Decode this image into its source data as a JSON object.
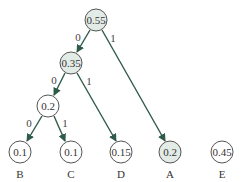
{
  "diagram": {
    "type": "huffman-tree",
    "colors": {
      "edge": "#2f5a48",
      "shaded_node": "#e2ebe6",
      "node_border": "#555555"
    },
    "nodes": {
      "root": {
        "value": "0.55",
        "shaded": true
      },
      "n035": {
        "value": "0.35",
        "shaded": true
      },
      "n02": {
        "value": "0.2",
        "shaded": false
      },
      "B": {
        "value": "0.1",
        "label": "B",
        "shaded": false
      },
      "C": {
        "value": "0.1",
        "label": "C",
        "shaded": false
      },
      "D": {
        "value": "0.15",
        "label": "D",
        "shaded": false
      },
      "A": {
        "value": "0.2",
        "label": "A",
        "shaded": true
      },
      "E": {
        "value": "0.45",
        "label": "E",
        "shaded": false
      }
    },
    "edges": [
      {
        "from": "root",
        "to": "n035",
        "bit": "0"
      },
      {
        "from": "root",
        "to": "A",
        "bit": "1"
      },
      {
        "from": "n035",
        "to": "n02",
        "bit": "0"
      },
      {
        "from": "n035",
        "to": "D",
        "bit": "1"
      },
      {
        "from": "n02",
        "to": "B",
        "bit": "0"
      },
      {
        "from": "n02",
        "to": "C",
        "bit": "1"
      }
    ]
  }
}
